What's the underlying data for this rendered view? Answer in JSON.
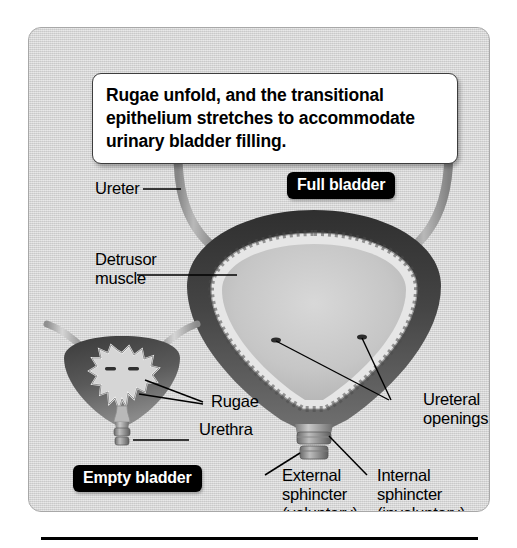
{
  "figure": {
    "caption": "Rugae unfold, and the transitional epithelium stretches to accommodate urinary bladder filling.",
    "panel_color": "#d3d3d3",
    "badge_color": "#000000",
    "badge_text_color": "#ffffff",
    "wall_color": "#3a3a3a",
    "lumen_color": "#c8c8c8",
    "mucosa_color": "#e8e8e8"
  },
  "badges": {
    "full_bladder": "Full bladder",
    "empty_bladder": "Empty bladder"
  },
  "labels": {
    "ureter": "Ureter",
    "detrusor_line1": "Detrusor",
    "detrusor_line2": "muscle",
    "rugae": "Rugae",
    "urethra": "Urethra",
    "ureteral_line1": "Ureteral",
    "ureteral_line2": "openings",
    "external_line1": "External",
    "external_line2": "sphincter",
    "external_line3": "(voluntary)",
    "internal_line1": "Internal",
    "internal_line2": "sphincter",
    "internal_line3": "(involuntary)"
  }
}
